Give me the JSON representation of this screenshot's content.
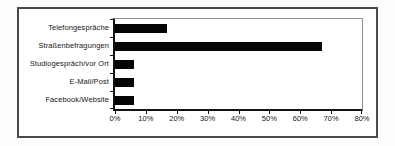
{
  "window": {
    "background": "#fdfdfd",
    "frame_border_color": "#4a4a4a",
    "plot_background": "#ffffff"
  },
  "chart_data": {
    "type": "bar",
    "orientation": "horizontal",
    "title": "",
    "xlabel": "",
    "ylabel": "",
    "categories": [
      "Telefongespräche",
      "Straßenbefragungen",
      "Studiogespräch/vor Ort",
      "E-Mail/Post",
      "Facebook/Website"
    ],
    "values": [
      17,
      67,
      6,
      6,
      6
    ],
    "value_unit": "%",
    "xlim": [
      0,
      80
    ],
    "x_tick_step": 10,
    "x_tick_labels": [
      "0%",
      "10%",
      "20%",
      "30%",
      "40%",
      "50%",
      "60%",
      "70%",
      "80%"
    ],
    "grid": false,
    "legend": "none",
    "bar_color": "#050505",
    "axis_color": "#111111"
  }
}
